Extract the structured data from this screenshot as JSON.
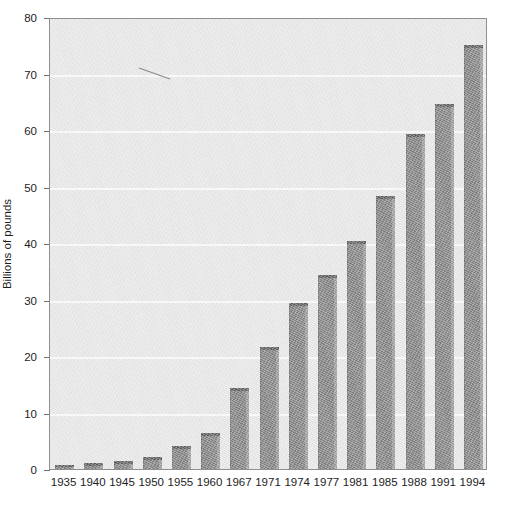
{
  "chart_data": {
    "type": "bar",
    "title": "",
    "subtitle": "",
    "xlabel": "",
    "ylabel": "Billions of pounds",
    "categories": [
      "1935",
      "1940",
      "1945",
      "1950",
      "1955",
      "1960",
      "1967",
      "1971",
      "1974",
      "1977",
      "1981",
      "1985",
      "1988",
      "1991",
      "1994"
    ],
    "values": [
      0.7,
      1.0,
      1.4,
      2.2,
      4.0,
      6.3,
      14.3,
      21.6,
      29.3,
      34.3,
      40.4,
      48.3,
      59.3,
      64.6,
      75.0
    ],
    "ylim": [
      0,
      80
    ],
    "yticks": [
      0,
      10,
      20,
      30,
      40,
      50,
      60,
      70,
      80
    ],
    "ytick_labels": [
      "0",
      "10",
      "20",
      "30",
      "40",
      "50",
      "60",
      "70",
      "80"
    ],
    "grid": true,
    "grid_axis": "y",
    "legend": null,
    "legend_position": "none",
    "annotations": [],
    "colors": {
      "bar_face": "#808080",
      "bar_top_edge": "#5c5c5c",
      "bar_right_edge": "#9a9a9a",
      "plot_background": "#e8e8e8",
      "gridline": "#fbfbfb",
      "axis_line": "#8f8f8f",
      "text": "#1d1d1d",
      "page_background": "#ffffff"
    }
  }
}
